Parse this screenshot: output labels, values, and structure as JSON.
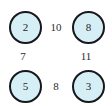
{
  "figure": {
    "type": "weighted-graph-diagram",
    "background_color": "#ffffff",
    "node_fill_color": "#d6eef5",
    "node_border_color": "#17181c",
    "label_color": "#25262b"
  },
  "nodes": [
    {
      "id": "top-left",
      "value": "2"
    },
    {
      "id": "top-right",
      "value": "8"
    },
    {
      "id": "bottom-left",
      "value": "5"
    },
    {
      "id": "bottom-right",
      "value": "3"
    }
  ],
  "edge_weights": [
    {
      "id": "top",
      "value": "10"
    },
    {
      "id": "left",
      "value": "7"
    },
    {
      "id": "right",
      "value": "11"
    },
    {
      "id": "bottom",
      "value": "8"
    }
  ]
}
